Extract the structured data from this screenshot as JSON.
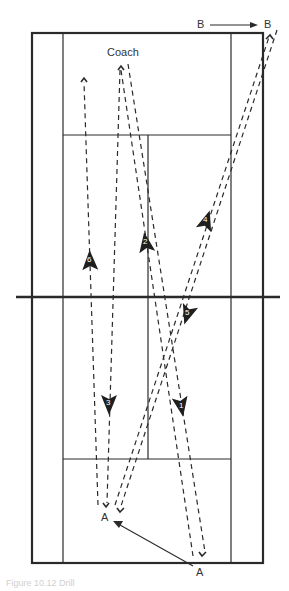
{
  "diagram": {
    "type": "tennis-court-drill",
    "labels": {
      "coach": "Coach",
      "player_a_start": "A",
      "player_a_end": "A",
      "player_b_start": "B",
      "player_b_end": "B"
    },
    "shot_numbers": [
      "1",
      "2",
      "3",
      "4",
      "5",
      "6"
    ],
    "caption": "Figure 10.12 Drill",
    "colors": {
      "line": "#2a2a2a",
      "arrow_fill": "#222222",
      "background": "#ffffff"
    }
  }
}
